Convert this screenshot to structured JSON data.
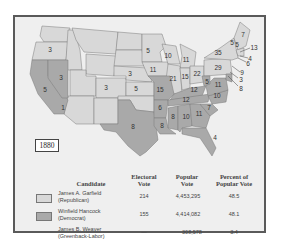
{
  "map": {
    "year": "1880",
    "colors": {
      "republican": "#d8d8d8",
      "democrat": "#a9a9a9",
      "border": "#777777",
      "background": "#efefef"
    },
    "state_labels": [
      {
        "state": "OR",
        "votes": "3"
      },
      {
        "state": "NV",
        "votes": "3"
      },
      {
        "state": "CA",
        "votes": "5"
      },
      {
        "state": "CA-split",
        "votes": "1"
      },
      {
        "state": "CO",
        "votes": "3"
      },
      {
        "state": "NE",
        "votes": "3"
      },
      {
        "state": "KS",
        "votes": "5"
      },
      {
        "state": "TX",
        "votes": "8"
      },
      {
        "state": "MN",
        "votes": "5"
      },
      {
        "state": "IA",
        "votes": "11"
      },
      {
        "state": "WI",
        "votes": "10"
      },
      {
        "state": "MI",
        "votes": "11"
      },
      {
        "state": "IL",
        "votes": "21"
      },
      {
        "state": "IN",
        "votes": "15"
      },
      {
        "state": "OH",
        "votes": "22"
      },
      {
        "state": "PA",
        "votes": "29"
      },
      {
        "state": "NY",
        "votes": "35"
      },
      {
        "state": "ME",
        "votes": "7"
      },
      {
        "state": "VT",
        "votes": "5"
      },
      {
        "state": "NH",
        "votes": "5"
      },
      {
        "state": "MA",
        "votes": "13"
      },
      {
        "state": "RI",
        "votes": "4"
      },
      {
        "state": "CT",
        "votes": "6"
      },
      {
        "state": "NJ",
        "votes": "9"
      },
      {
        "state": "DE",
        "votes": "3"
      },
      {
        "state": "MD",
        "votes": "8"
      },
      {
        "state": "WV",
        "votes": "5"
      },
      {
        "state": "VA",
        "votes": "11"
      },
      {
        "state": "MO",
        "votes": "15"
      },
      {
        "state": "KY",
        "votes": "12"
      },
      {
        "state": "TN",
        "votes": "12"
      },
      {
        "state": "NC",
        "votes": "10"
      },
      {
        "state": "SC",
        "votes": "7"
      },
      {
        "state": "AR",
        "votes": "6"
      },
      {
        "state": "LA",
        "votes": "8"
      },
      {
        "state": "MS",
        "votes": "8"
      },
      {
        "state": "AL",
        "votes": "10"
      },
      {
        "state": "GA",
        "votes": "11"
      },
      {
        "state": "FL",
        "votes": "4"
      }
    ]
  },
  "table": {
    "headers": {
      "candidate": "Candidate",
      "electoral_1": "Electoral",
      "electoral_2": "Vote",
      "popular_1": "Popular",
      "popular_2": "Vote",
      "percent_1": "Percent of",
      "percent_2": "Popular Vote"
    },
    "rows": [
      {
        "name": "James A. Garfield",
        "party": "(Republican)",
        "electoral": "214",
        "popular": "4,453,295",
        "percent": "48.5",
        "swatch": "#d8d8d8"
      },
      {
        "name": "Winfield Hancock",
        "party": "(Democrat)",
        "electoral": "155",
        "popular": "4,414,082",
        "percent": "48.1",
        "swatch": "#a9a9a9"
      },
      {
        "name": "James B. Weaver",
        "party": "(Greenback-Labor)",
        "electoral": "—",
        "popular": "308,578",
        "percent": "3.4"
      }
    ]
  }
}
